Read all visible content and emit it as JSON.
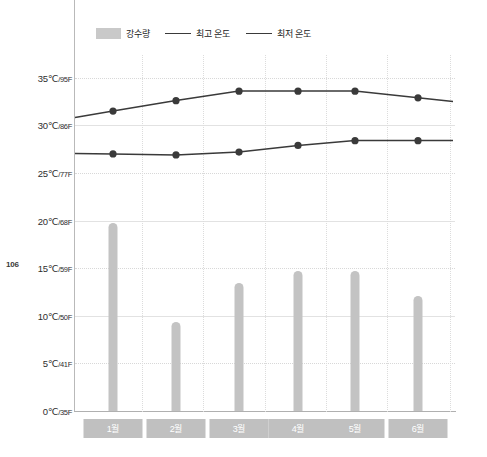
{
  "page": {
    "folio": "106"
  },
  "legend": {
    "items": [
      {
        "label": "강수량",
        "type": "bar",
        "color": "#c9c9c9",
        "icon": "bar-swatch-icon"
      },
      {
        "label": "최고 온도",
        "type": "line",
        "color": "#3a3a3a",
        "icon": "line-swatch-icon"
      },
      {
        "label": "최저 온도",
        "type": "line",
        "color": "#3a3a3a",
        "icon": "line-swatch-icon"
      }
    ]
  },
  "axis": {
    "y_ticks": [
      {
        "c": "0℃",
        "f": "/35F",
        "value": 0
      },
      {
        "c": "5℃",
        "f": "/41F",
        "value": 5
      },
      {
        "c": "10℃",
        "f": "/50F",
        "value": 10
      },
      {
        "c": "15℃",
        "f": "/59F",
        "value": 15
      },
      {
        "c": "20℃",
        "f": "/68F",
        "value": 20
      },
      {
        "c": "25℃",
        "f": "/77F",
        "value": 25
      },
      {
        "c": "30℃",
        "f": "/86F",
        "value": 30
      },
      {
        "c": "35℃",
        "f": "/95F",
        "value": 35
      }
    ],
    "x_categories": [
      "1월",
      "2월",
      "3월",
      "4월",
      "5월",
      "6월"
    ]
  },
  "chart_data": {
    "type": "bar",
    "title": "",
    "subtitle": "",
    "xlabel": "",
    "ylabel": "",
    "ylim": [
      0,
      37
    ],
    "ytick_values": [
      0,
      5,
      10,
      15,
      20,
      25,
      30,
      35
    ],
    "ytick_labels": [
      "0℃/35F",
      "5℃/41F",
      "10℃/50F",
      "15℃/59F",
      "20℃/68F",
      "25℃/77F",
      "30℃/86F",
      "35℃/95F"
    ],
    "grid": true,
    "legend_position": "top-left",
    "categories": [
      "1월",
      "2월",
      "3월",
      "4월",
      "5월",
      "6월"
    ],
    "series": [
      {
        "name": "강수량",
        "type": "bar",
        "color": "#c3c3c3",
        "values": [
          19.7,
          9.4,
          13.4,
          14.7,
          14.7,
          12.1
        ]
      },
      {
        "name": "최고 온도",
        "type": "line",
        "color": "#3a3a3a",
        "values": [
          31.5,
          32.6,
          33.6,
          33.6,
          33.6,
          32.9
        ]
      },
      {
        "name": "최저 온도",
        "type": "line",
        "color": "#3a3a3a",
        "values": [
          27.0,
          26.9,
          27.2,
          27.9,
          28.4,
          28.4
        ]
      }
    ]
  }
}
